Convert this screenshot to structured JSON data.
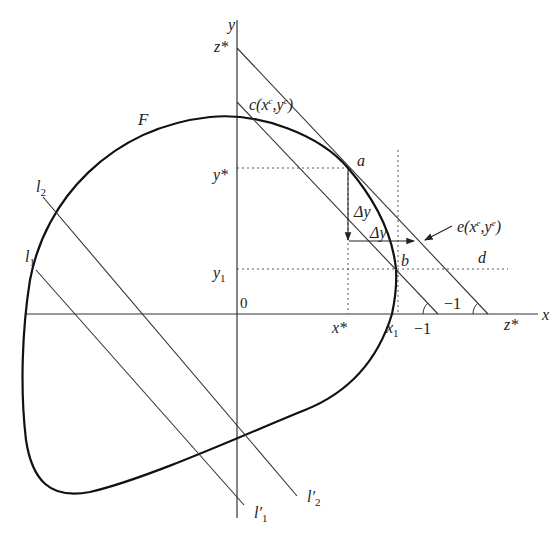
{
  "diagram": {
    "type": "production-possibility / convex set tangency diagram",
    "axes": {
      "x_label": "x",
      "y_label": "y",
      "origin_label": "0"
    },
    "curve": {
      "label": "F"
    },
    "points": {
      "a": "a",
      "b": "b",
      "c": "c(x",
      "c_sup1": "c",
      "c_mid": ",y",
      "c_sup2": "c",
      "c_close": ")",
      "d": "d",
      "e": "e(x",
      "e_sup1": "e",
      "e_mid": ",y",
      "e_sup2": "e",
      "e_close": ")"
    },
    "ticks": {
      "y_star": "y*",
      "y1": "y",
      "y1_sub": "1",
      "x_star": "x*",
      "x1": "x",
      "x1_sub": "1",
      "z_star_y": "z*",
      "z_star_x": "z*"
    },
    "slopes": {
      "slope_inner": "−1",
      "slope_outer": "−1"
    },
    "increments": {
      "delta_y_vertical": "Δy",
      "delta_y_horizontal": "Δy"
    },
    "lines": {
      "l1": "l",
      "l1_sub": "1",
      "l2": "l",
      "l2_sub": "2",
      "l1_prime": "l′",
      "l1_prime_sub": "1",
      "l2_prime": "l′",
      "l2_prime_sub": "2"
    }
  }
}
